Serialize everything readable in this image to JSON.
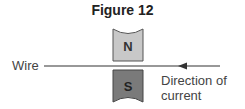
{
  "figure": {
    "title": "Figure 12",
    "wire_label": "Wire",
    "direction_label_line1": "Direction of",
    "direction_label_line2": "current",
    "north_pole": "N",
    "south_pole": "S",
    "colors": {
      "north": "#c8c8c8",
      "south": "#7a7a7a",
      "wire": "#333333"
    }
  }
}
